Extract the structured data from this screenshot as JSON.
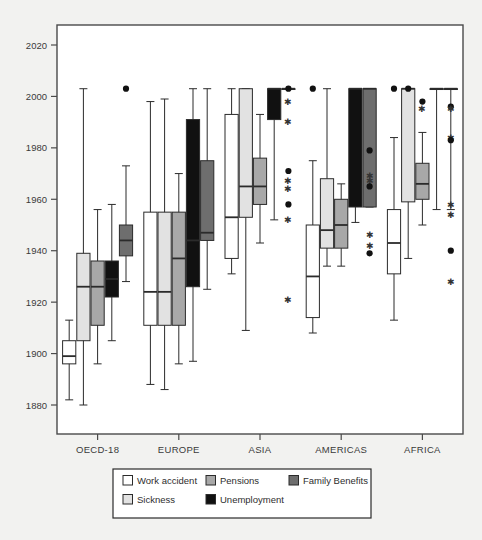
{
  "chart_data": {
    "type": "box",
    "title": "",
    "xlabel": "",
    "ylabel": "",
    "categories": [
      "OECD-18",
      "EUROPE",
      "ASIA",
      "AMERICAS",
      "AFRICA"
    ],
    "ylim": [
      1872,
      2028
    ],
    "yticks": [
      1880,
      1900,
      1920,
      1940,
      1960,
      1980,
      2000,
      2020
    ],
    "ytick_labels": [
      "1880",
      "1900",
      "1920",
      "1940",
      "1960",
      "1980",
      "2000",
      "2020"
    ],
    "grid": false,
    "legend_position": "bottom",
    "series": [
      {
        "name": "Work accident",
        "color": "#ffffff"
      },
      {
        "name": "Sickness",
        "color": "#e2e2e2"
      },
      {
        "name": "Pensions",
        "color": "#a8a8a8"
      },
      {
        "name": "Unemployment",
        "color": "#111111"
      },
      {
        "name": "Family Benefits",
        "color": "#6e6e6e"
      }
    ],
    "groups": [
      {
        "category": "OECD-18",
        "boxes": [
          {
            "series": "Work accident",
            "whisker_low": 1882,
            "q1": 1896,
            "median": 1899,
            "q3": 1905,
            "whisker_high": 1913,
            "outliers": []
          },
          {
            "series": "Sickness",
            "whisker_low": 1880,
            "q1": 1905,
            "median": 1926,
            "q3": 1939,
            "whisker_high": 2003,
            "outliers": []
          },
          {
            "series": "Pensions",
            "whisker_low": 1896,
            "q1": 1911,
            "median": 1926,
            "q3": 1936,
            "whisker_high": 1956,
            "outliers": []
          },
          {
            "series": "Unemployment",
            "whisker_low": 1905,
            "q1": 1922,
            "median": 1929,
            "q3": 1936,
            "whisker_high": 1958,
            "outliers": []
          },
          {
            "series": "Family Benefits",
            "whisker_low": 1928,
            "q1": 1938,
            "median": 1944,
            "q3": 1950,
            "whisker_high": 1973,
            "outliers": [
              2003
            ]
          }
        ]
      },
      {
        "category": "EUROPE",
        "boxes": [
          {
            "series": "Work accident",
            "whisker_low": 1888,
            "q1": 1911,
            "median": 1924,
            "q3": 1955,
            "whisker_high": 1998,
            "outliers": []
          },
          {
            "series": "Sickness",
            "whisker_low": 1886,
            "q1": 1911,
            "median": 1924,
            "q3": 1955,
            "whisker_high": 1999,
            "outliers": []
          },
          {
            "series": "Pensions",
            "whisker_low": 1896,
            "q1": 1911,
            "median": 1937,
            "q3": 1955,
            "whisker_high": 1970,
            "outliers": []
          },
          {
            "series": "Unemployment",
            "whisker_low": 1897,
            "q1": 1926,
            "median": 1944,
            "q3": 1991,
            "whisker_high": 2003,
            "outliers": []
          },
          {
            "series": "Family Benefits",
            "whisker_low": 1925,
            "q1": 1944,
            "median": 1947,
            "q3": 1975,
            "whisker_high": 2003,
            "outliers": []
          }
        ]
      },
      {
        "category": "ASIA",
        "boxes": [
          {
            "series": "Work accident",
            "whisker_low": 1931,
            "q1": 1937,
            "median": 1953,
            "q3": 1993,
            "whisker_high": 2003,
            "outliers": []
          },
          {
            "series": "Sickness",
            "whisker_low": 1909,
            "q1": 1953,
            "median": 1965,
            "q3": 2003,
            "whisker_high": 2003,
            "outliers": []
          },
          {
            "series": "Pensions",
            "whisker_low": 1943,
            "q1": 1958,
            "median": 1965,
            "q3": 1976,
            "whisker_high": 1993,
            "outliers": []
          },
          {
            "series": "Unemployment",
            "whisker_low": 1952,
            "q1": 1991,
            "median": 2003,
            "q3": 2003,
            "whisker_high": 2003,
            "outliers": []
          },
          {
            "series": "Family Benefits",
            "whisker_low": 2003,
            "q1": 2003,
            "median": 2003,
            "q3": 2003,
            "whisker_high": 2003,
            "outliers": [
              2003,
              1998,
              1990,
              1971,
              1967,
              1964,
              1958,
              1952,
              1921
            ]
          }
        ]
      },
      {
        "category": "AMERICAS",
        "boxes": [
          {
            "series": "Work accident",
            "whisker_low": 1908,
            "q1": 1914,
            "median": 1930,
            "q3": 1950,
            "whisker_high": 1975,
            "outliers": [
              2003
            ]
          },
          {
            "series": "Sickness",
            "whisker_low": 1934,
            "q1": 1941,
            "median": 1948,
            "q3": 1968,
            "whisker_high": 2003,
            "outliers": []
          },
          {
            "series": "Pensions",
            "whisker_low": 1934,
            "q1": 1941,
            "median": 1950,
            "q3": 1960,
            "whisker_high": 1966,
            "outliers": []
          },
          {
            "series": "Unemployment",
            "whisker_low": 1951,
            "q1": 1957,
            "median": 2003,
            "q3": 2003,
            "whisker_high": 2003,
            "outliers": []
          },
          {
            "series": "Family Benefits",
            "whisker_low": 1957,
            "q1": 1957,
            "median": 2003,
            "q3": 2003,
            "whisker_high": 2003,
            "outliers": [
              1979,
              1969,
              1967,
              1965,
              1946,
              1942,
              1939
            ]
          }
        ]
      },
      {
        "category": "AFRICA",
        "boxes": [
          {
            "series": "Work accident",
            "whisker_low": 1913,
            "q1": 1931,
            "median": 1943,
            "q3": 1956,
            "whisker_high": 1984,
            "outliers": [
              2003
            ]
          },
          {
            "series": "Sickness",
            "whisker_low": 1937,
            "q1": 1959,
            "median": 2003,
            "q3": 2003,
            "whisker_high": 2003,
            "outliers": [
              2003
            ]
          },
          {
            "series": "Pensions",
            "whisker_low": 1950,
            "q1": 1960,
            "median": 1966,
            "q3": 1974,
            "whisker_high": 1986,
            "outliers": [
              1998,
              1995
            ]
          },
          {
            "series": "Unemployment",
            "whisker_low": 1956,
            "q1": 2003,
            "median": 2003,
            "q3": 2003,
            "whisker_high": 2003,
            "outliers": []
          },
          {
            "series": "Family Benefits",
            "whisker_low": 1956,
            "q1": 2003,
            "median": 2003,
            "q3": 2003,
            "whisker_high": 2003,
            "outliers": [
              1996,
              1995,
              1984,
              1983,
              1958,
              1954,
              1940,
              1928
            ]
          }
        ]
      }
    ]
  },
  "legend": {
    "items": [
      {
        "label": "Work accident",
        "color": "#ffffff"
      },
      {
        "label": "Sickness",
        "color": "#e2e2e2"
      },
      {
        "label": "Pensions",
        "color": "#a8a8a8"
      },
      {
        "label": "Unemployment",
        "color": "#111111"
      },
      {
        "label": "Family Benefits",
        "color": "#6e6e6e"
      }
    ]
  },
  "colors": {
    "figure_background": "#f2f2f0",
    "plot_background": "#ffffff",
    "axis": "#4a4a4a",
    "text": "#3a3a3a",
    "box_outline": "#2b2b2b"
  }
}
